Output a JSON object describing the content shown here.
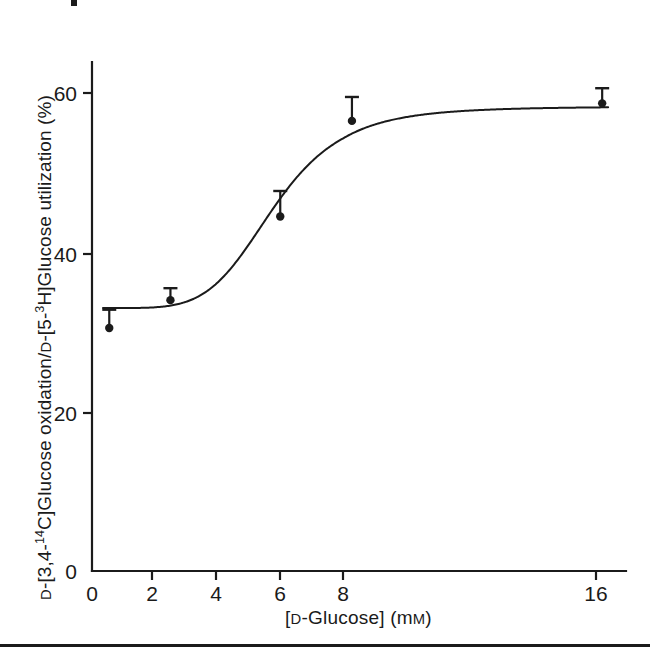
{
  "figure": {
    "background_color": "#ffffff",
    "ink_color": "#1b1b1b",
    "corner_mark": "partial-mark",
    "bottom_rule": "horizontal-rule"
  },
  "axes": {
    "x": {
      "label_prefix": "[",
      "label_smallcap_d": "D",
      "label_mid": "-Glucose] (m",
      "label_smallcap_m": "M",
      "label_suffix": ")",
      "label_full": "[D-Glucose] (mM)",
      "ticks": [
        "0",
        "2",
        "4",
        "6",
        "8",
        "16"
      ],
      "tick_values": [
        0,
        2,
        4,
        6,
        8,
        16
      ]
    },
    "y": {
      "label_full": "D-[3,4-14C]Glucose oxidation/D-[5-3H]Glucose utilization (%)",
      "label_part1_smallcap": "D",
      "label_part2": "-[3,4-",
      "label_sup1": "14",
      "label_part3": "C]Glucose oxidation/",
      "label_part4_smallcap": "D",
      "label_part5": "-[5-",
      "label_sup2": "3",
      "label_part6": "H]Glucose utilization (%)",
      "ticks": [
        "0",
        "20",
        "40",
        "60"
      ],
      "tick_values": [
        0,
        20,
        40,
        60
      ]
    }
  },
  "chart_data": {
    "type": "line",
    "title": "",
    "xlabel": "[D-Glucose] (mM)",
    "ylabel": "D-[3,4-14C]Glucose oxidation/D-[5-3H]Glucose utilization (%)",
    "xlim": [
      0,
      17.5
    ],
    "ylim": [
      0,
      64
    ],
    "xticks": [
      0,
      2,
      4,
      6,
      8,
      16
    ],
    "yticks": [
      0,
      20,
      40,
      60
    ],
    "grid": false,
    "legend": "none",
    "axis_note": "x-axis compressed/broken between 8 and 16 mM",
    "series": [
      {
        "name": "D-[3,4-14C]Glucose oxidation / D-[5-3H]Glucose utilization",
        "x": [
          0.55,
          2.5,
          6.0,
          8.3,
          16.7
        ],
        "y": [
          30.5,
          34.0,
          44.5,
          56.5,
          58.7
        ],
        "yerr_upper": [
          2.3,
          1.5,
          3.2,
          3.0,
          1.9
        ],
        "yerr_lower": [
          0,
          0,
          0,
          0,
          0
        ],
        "marker": "filled-circle",
        "errorbar": "upward-only"
      }
    ],
    "fitted_curve": {
      "description": "sigmoidal fit through the data points",
      "lower_plateau": 33.0,
      "upper_plateau": 58.3,
      "midpoint_mM": 5.8,
      "hill_slope": 5.2
    }
  }
}
